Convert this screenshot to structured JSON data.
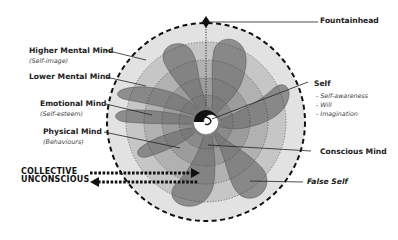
{
  "title": "",
  "labels": {
    "fountainhead": "Fountainhead",
    "higher_mental_mind": "Higher Mental Mind",
    "higher_mental_mind_sub": "(Self-image)",
    "lower_mental_mind": "Lower Mental Mind",
    "emotional_mind": "Emotional Mind",
    "emotional_mind_sub": "(Self-esteem)",
    "physical_mind": "Physical Mind",
    "physical_mind_sub": "(Behaviours)",
    "self": "Self",
    "self_items": [
      "- Self-awareness",
      "- Will",
      "- Imagination"
    ],
    "conscious_mind": "Conscious Mind",
    "false_self": "False Self",
    "collective_line1": "COLLECTIVE",
    "collective_line2": "UNCONSCIOUS"
  },
  "colors": {
    "outer_ring": "#e2e2e2",
    "ring2": "#c4c4c4",
    "ring3": "#a9a9a9",
    "ring4": "#8f8f8f",
    "false_self_shape": "#6e6e6e",
    "dark": "#111111"
  }
}
